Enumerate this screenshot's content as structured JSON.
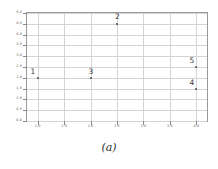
{
  "figure": {
    "caption": "(a)",
    "background_color": "#ffffff",
    "frame_color": "#9a9a9a",
    "grid_color": "#d4d4d4",
    "point_color": "#4a4a4a",
    "label_color": "#555555"
  },
  "chart_data": {
    "type": "scatter",
    "title": "",
    "xlabel": "",
    "ylabel": "",
    "xlim": [
      0.8,
      4.2
    ],
    "ylim": [
      0.0,
      5.0
    ],
    "grid": true,
    "legend": "none",
    "xticks": [
      "1.0",
      "1.5",
      "2.0",
      "2.5",
      "3.0",
      "3.5",
      "4.0"
    ],
    "xtick_values": [
      1.0,
      1.5,
      2.0,
      2.5,
      3.0,
      3.5,
      4.0
    ],
    "yticks": [
      "0.0",
      "0.5",
      "1.0",
      "1.5",
      "2.0",
      "2.5",
      "3.0",
      "3.5",
      "4.0",
      "4.5",
      "5.0"
    ],
    "ytick_values": [
      0.0,
      0.5,
      1.0,
      1.5,
      2.0,
      2.5,
      3.0,
      3.5,
      4.0,
      4.5,
      5.0
    ],
    "points": [
      {
        "label": "1",
        "x": 1.0,
        "y": 2.0,
        "label_dx": -7,
        "label_dy": -10
      },
      {
        "label": "2",
        "x": 2.5,
        "y": 4.5,
        "label_dx": -2,
        "label_dy": -11
      },
      {
        "label": "3",
        "x": 2.0,
        "y": 2.0,
        "label_dx": -2,
        "label_dy": -10
      },
      {
        "label": "5",
        "x": 4.0,
        "y": 2.5,
        "label_dx": -7,
        "label_dy": -10
      },
      {
        "label": "4",
        "x": 4.0,
        "y": 1.5,
        "label_dx": -7,
        "label_dy": -10
      }
    ]
  }
}
